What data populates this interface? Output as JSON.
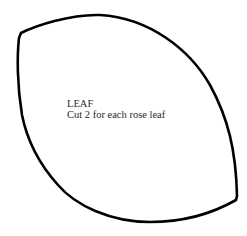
{
  "template": {
    "title": "LEAF",
    "instruction": "Cut 2 for each rose leaf"
  },
  "colors": {
    "outline": "#000000",
    "text": "#2a2a2a",
    "background": "#ffffff"
  }
}
